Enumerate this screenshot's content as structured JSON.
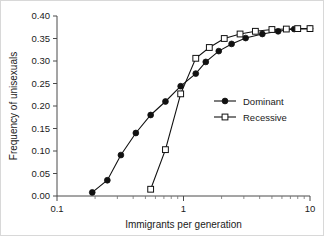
{
  "chart_data": {
    "type": "line",
    "title": "",
    "xlabel": "Immigrants per generation",
    "ylabel": "Frequency of unisexuals",
    "xscale": "log",
    "xlim": [
      0.1,
      10
    ],
    "ylim": [
      0.0,
      0.4
    ],
    "yticks": [
      0.0,
      0.05,
      0.1,
      0.15,
      0.2,
      0.25,
      0.3,
      0.35,
      0.4
    ],
    "ytick_labels": [
      "0.00",
      "0.05",
      "0.10",
      "0.15",
      "0.20",
      "0.25",
      "0.30",
      "0.35",
      "0.40"
    ],
    "xticks": [
      0.1,
      1,
      10
    ],
    "xtick_labels": [
      "0.1",
      "1",
      "10"
    ],
    "grid": false,
    "legend_position": "center-right",
    "series": [
      {
        "name": "Dominant",
        "marker": "filled-circle",
        "x": [
          0.19,
          0.25,
          0.32,
          0.42,
          0.55,
          0.72,
          0.95,
          1.25,
          1.5,
          1.9,
          2.4,
          3.1,
          4.2,
          5.6,
          7.5,
          10.0
        ],
        "y": [
          0.008,
          0.035,
          0.091,
          0.14,
          0.18,
          0.21,
          0.244,
          0.272,
          0.298,
          0.322,
          0.338,
          0.351,
          0.36,
          0.366,
          0.371,
          0.372
        ]
      },
      {
        "name": "Recessive",
        "marker": "open-square",
        "x": [
          0.55,
          0.72,
          0.95,
          1.25,
          1.6,
          2.1,
          2.8,
          3.7,
          5.0,
          6.5,
          8.0,
          10.0
        ],
        "y": [
          0.015,
          0.103,
          0.227,
          0.306,
          0.33,
          0.35,
          0.36,
          0.366,
          0.37,
          0.371,
          0.372,
          0.372
        ]
      }
    ]
  },
  "legend": {
    "entries": [
      {
        "label": "Dominant"
      },
      {
        "label": "Recessive"
      }
    ]
  },
  "axes": {
    "y_title": "Frequency of unisexuals",
    "x_title": "Immigrants per generation"
  },
  "colors": {
    "line": "#111111",
    "axis": "#4a4a4a",
    "background": "#ffffff",
    "text": "#1a1a1a"
  }
}
